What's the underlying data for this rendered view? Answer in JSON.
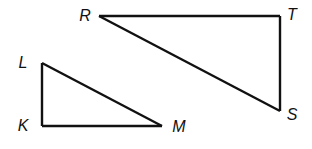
{
  "diagram": {
    "type": "geometry-figure",
    "triangles": [
      {
        "name": "triangle-RST",
        "vertices": [
          "R",
          "T",
          "S"
        ],
        "right_angle_at": "T",
        "sides": [
          "RT",
          "TS",
          "SR"
        ]
      },
      {
        "name": "triangle-LKM",
        "vertices": [
          "L",
          "K",
          "M"
        ],
        "right_angle_at": "K",
        "sides": [
          "LK",
          "KM",
          "ML"
        ]
      }
    ],
    "labels": {
      "R": "R",
      "T": "T",
      "S": "S",
      "L": "L",
      "K": "K",
      "M": "M"
    },
    "line_color": "#111111"
  }
}
